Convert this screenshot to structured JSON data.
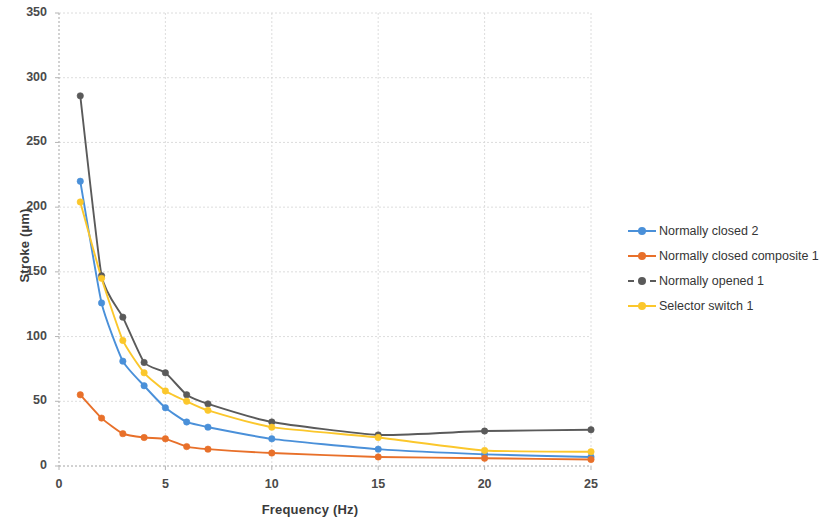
{
  "chart_data": {
    "type": "line",
    "title": "",
    "xlabel": "Frequency (Hz)",
    "ylabel": "Stroke (µm)",
    "xlim": [
      0,
      25
    ],
    "ylim": [
      0,
      350
    ],
    "xticks": [
      0,
      5,
      10,
      15,
      20,
      25
    ],
    "yticks": [
      0,
      50,
      100,
      150,
      200,
      250,
      300,
      350
    ],
    "grid": true,
    "legend_position": "right",
    "x": [
      1,
      2,
      3,
      4,
      5,
      6,
      7,
      10,
      15,
      20,
      25
    ],
    "series": [
      {
        "name": "Normally closed 2",
        "color": "#4a90d9",
        "values": [
          220,
          126,
          81,
          62,
          45,
          34,
          30,
          21,
          13,
          9,
          7
        ]
      },
      {
        "name": "Normally closed composite 1",
        "color": "#e8702a",
        "values": [
          55,
          37,
          25,
          22,
          21,
          15,
          13,
          10,
          7,
          6,
          5
        ]
      },
      {
        "name": "Normally opened 1",
        "color": "#5a5a5a",
        "values": [
          286,
          147,
          115,
          80,
          72,
          55,
          48,
          34,
          24,
          27,
          28
        ]
      },
      {
        "name": "Selector switch 1",
        "color": "#fbc72c",
        "values": [
          204,
          145,
          97,
          72,
          58,
          50,
          43,
          30,
          22,
          12,
          11
        ]
      }
    ]
  },
  "legend": {
    "items": [
      {
        "label": "Normally closed 2"
      },
      {
        "label": "Normally closed composite 1"
      },
      {
        "label": "Normally opened 1"
      },
      {
        "label": "Selector switch 1"
      }
    ]
  },
  "axes": {
    "x_title": "Frequency (Hz)",
    "y_title": "Stroke (µm)",
    "x_tick_labels": [
      "0",
      "5",
      "10",
      "15",
      "20",
      "25"
    ],
    "y_tick_labels": [
      "0",
      "50",
      "100",
      "150",
      "200",
      "250",
      "300",
      "350"
    ]
  },
  "colors": {
    "series_blue": "#4a90d9",
    "series_orange": "#e8702a",
    "series_gray": "#5a5a5a",
    "series_yellow": "#fbc72c",
    "grid": "#d8d8d8",
    "axis": "#b5b5b5",
    "text": "#3d3d3d"
  }
}
